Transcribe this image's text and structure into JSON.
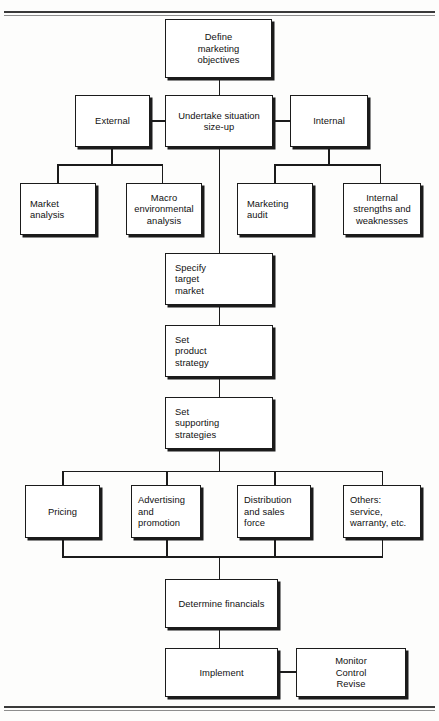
{
  "document": {
    "header_ghost": "",
    "rules": {
      "top": "horizontal-rule",
      "bottom": "horizontal-rule"
    }
  },
  "diagram": {
    "type": "flowchart",
    "nodes": [
      {
        "id": "define-marketing-objectives",
        "label": "Define\nmarketing\nobjectives",
        "align": "center"
      },
      {
        "id": "external",
        "label": "External",
        "align": "center"
      },
      {
        "id": "undertake-situation-size-up",
        "label": "Undertake situation\nsize-up",
        "align": "center"
      },
      {
        "id": "internal",
        "label": "Internal",
        "align": "center"
      },
      {
        "id": "market-analysis",
        "label": "Market\nanalysis",
        "align": "left"
      },
      {
        "id": "macro-environmental-analysis",
        "label": "Macro\nenvironmental\nanalysis",
        "align": "center"
      },
      {
        "id": "marketing-audit",
        "label": "Marketing\naudit",
        "align": "left"
      },
      {
        "id": "internal-strengths-and-weaknesses",
        "label": "Internal\nstrengths and\nweaknesses",
        "align": "center"
      },
      {
        "id": "specify-target-market",
        "label": "Specify\ntarget\nmarket",
        "align": "left"
      },
      {
        "id": "set-product-strategy",
        "label": "Set\nproduct\nstrategy",
        "align": "left"
      },
      {
        "id": "set-supporting-strategies",
        "label": "Set\nsupporting\nstrategies",
        "align": "left"
      },
      {
        "id": "pricing",
        "label": "Pricing",
        "align": "center"
      },
      {
        "id": "advertising-and-promotion",
        "label": "Advertising\nand\npromotion",
        "align": "left"
      },
      {
        "id": "distribution-and-sales-force",
        "label": "Distribution\nand sales\nforce",
        "align": "left"
      },
      {
        "id": "others-service-warranty-etc",
        "label": "Others:\nservice,\nwarranty, etc.",
        "align": "left"
      },
      {
        "id": "determine-financials",
        "label": "Determine financials",
        "align": "center"
      },
      {
        "id": "implement",
        "label": "Implement",
        "align": "center"
      },
      {
        "id": "monitor-control-revise",
        "label": "Monitor\nControl\nRevise",
        "align": "center"
      }
    ],
    "edges": [
      {
        "from": "define-marketing-objectives",
        "to": "undertake-situation-size-up"
      },
      {
        "from": "undertake-situation-size-up",
        "to": "external"
      },
      {
        "from": "undertake-situation-size-up",
        "to": "internal"
      },
      {
        "from": "external",
        "to": "market-analysis"
      },
      {
        "from": "external",
        "to": "macro-environmental-analysis"
      },
      {
        "from": "internal",
        "to": "marketing-audit"
      },
      {
        "from": "internal",
        "to": "internal-strengths-and-weaknesses"
      },
      {
        "from": "undertake-situation-size-up",
        "to": "specify-target-market"
      },
      {
        "from": "specify-target-market",
        "to": "set-product-strategy"
      },
      {
        "from": "set-product-strategy",
        "to": "set-supporting-strategies"
      },
      {
        "from": "set-supporting-strategies",
        "to": "pricing"
      },
      {
        "from": "set-supporting-strategies",
        "to": "advertising-and-promotion"
      },
      {
        "from": "set-supporting-strategies",
        "to": "distribution-and-sales-force"
      },
      {
        "from": "set-supporting-strategies",
        "to": "others-service-warranty-etc"
      },
      {
        "from": "pricing",
        "to": "determine-financials"
      },
      {
        "from": "advertising-and-promotion",
        "to": "determine-financials"
      },
      {
        "from": "distribution-and-sales-force",
        "to": "determine-financials"
      },
      {
        "from": "others-service-warranty-etc",
        "to": "determine-financials"
      },
      {
        "from": "determine-financials",
        "to": "implement"
      },
      {
        "from": "implement",
        "to": "monitor-control-revise"
      }
    ],
    "colors": {
      "line": "#1b1b1b",
      "box_fill": "#ffffff",
      "text": "#111111"
    }
  }
}
